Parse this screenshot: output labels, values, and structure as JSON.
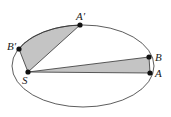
{
  "diagram": {
    "ellipse": {
      "cx": 83,
      "cy": 66,
      "rx": 71,
      "ry": 41
    },
    "colors": {
      "fill": "#c4c4c4",
      "stroke": "#333333",
      "point": "#111111"
    },
    "points": [
      {
        "id": "S",
        "label": "S",
        "x": 28,
        "y": 72,
        "lx": 20,
        "ly": 84
      },
      {
        "id": "A",
        "label": "A",
        "x": 150,
        "y": 73,
        "lx": 157,
        "ly": 77
      },
      {
        "id": "B",
        "label": "B",
        "x": 149,
        "y": 57,
        "lx": 156,
        "ly": 61
      },
      {
        "id": "A'",
        "label": "A′",
        "x": 80,
        "y": 25,
        "lx": 77,
        "ly": 20
      },
      {
        "id": "B'",
        "label": "B′",
        "x": 19,
        "y": 49,
        "lx": 8,
        "ly": 50
      }
    ]
  }
}
